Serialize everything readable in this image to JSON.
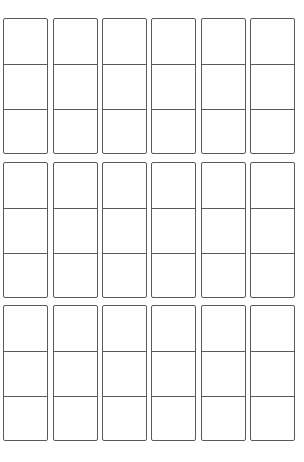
{
  "sheet": {
    "type": "blank-storyboard-template",
    "blocks": 3,
    "strips_per_block": 6,
    "cells_per_strip": 3,
    "stroke_color": "#5a5a5a",
    "background_color": "#ffffff"
  }
}
